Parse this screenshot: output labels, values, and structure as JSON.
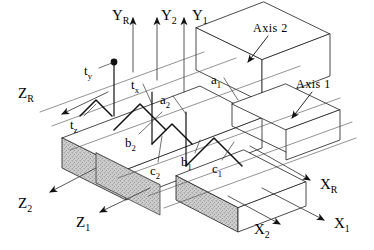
{
  "figure": {
    "kind": "isometric-engineering-diagram",
    "stroke_color": "#1a1a1a",
    "hatch_fill_color": "#c9c9c9",
    "background_color": "#ffffff"
  },
  "axes": [
    {
      "id": "y-r",
      "base": "Y",
      "sub": "R",
      "label": "YR",
      "direction": "up",
      "x": 112,
      "y": 8
    },
    {
      "id": "y-2",
      "base": "Y",
      "sub": "2",
      "label": "Y2",
      "direction": "up",
      "x": 161,
      "y": 8
    },
    {
      "id": "y-1",
      "base": "Y",
      "sub": "1",
      "label": "Y1",
      "direction": "up",
      "x": 192,
      "y": 8
    },
    {
      "id": "z-r",
      "base": "Z",
      "sub": "R",
      "label": "ZR",
      "direction": "down-left",
      "x": 18,
      "y": 86
    },
    {
      "id": "z-2",
      "base": "Z",
      "sub": "2",
      "label": "Z2",
      "direction": "down-left",
      "x": 18,
      "y": 196
    },
    {
      "id": "z-1",
      "base": "Z",
      "sub": "1",
      "label": "Z1",
      "direction": "down-left",
      "x": 76,
      "y": 215
    },
    {
      "id": "x-r",
      "base": "X",
      "sub": "R",
      "label": "XR",
      "direction": "down-right",
      "x": 320,
      "y": 177
    },
    {
      "id": "x-2",
      "base": "X",
      "sub": "2",
      "label": "X2",
      "direction": "down-right",
      "x": 254,
      "y": 222
    },
    {
      "id": "x-1",
      "base": "X",
      "sub": "1",
      "label": "X1",
      "direction": "down-right",
      "x": 334,
      "y": 216
    }
  ],
  "callouts": [
    {
      "id": "axis-2",
      "label": "Axis  2",
      "x": 253,
      "y": 22
    },
    {
      "id": "axis-1",
      "label": "Axis  1",
      "x": 296,
      "y": 78
    }
  ],
  "dimensions": [
    {
      "id": "t-y",
      "base": "t",
      "sub": "y",
      "label": "ty",
      "x": 84,
      "y": 64
    },
    {
      "id": "t-x",
      "base": "t",
      "sub": "x",
      "label": "tx",
      "x": 131,
      "y": 78
    },
    {
      "id": "t-z",
      "base": "t",
      "sub": "z",
      "label": "tz",
      "x": 70,
      "y": 118
    },
    {
      "id": "a-1",
      "base": "a",
      "sub": "1",
      "label": "a1",
      "x": 211,
      "y": 73
    },
    {
      "id": "a-2",
      "base": "a",
      "sub": "2",
      "label": "a2",
      "x": 160,
      "y": 93
    },
    {
      "id": "b-2",
      "base": "b",
      "sub": "2",
      "label": "b2",
      "x": 125,
      "y": 136
    },
    {
      "id": "b-1",
      "base": "b",
      "sub": "1",
      "label": "b1",
      "x": 181,
      "y": 155
    },
    {
      "id": "c-2",
      "base": "c",
      "sub": "2",
      "label": "c2",
      "x": 150,
      "y": 164
    },
    {
      "id": "c-1",
      "base": "c",
      "sub": "1",
      "label": "c1",
      "x": 212,
      "y": 162
    }
  ]
}
